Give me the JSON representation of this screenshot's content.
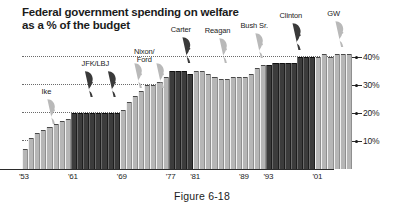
{
  "figure": {
    "caption": "Figure 6-18"
  },
  "chart_data": {
    "type": "bar",
    "title": "Federal government spending on welfare as a % of the budget",
    "title_lines": [
      "Federal government spending on welfare",
      "as a % of the budget"
    ],
    "xlabel": "",
    "ylabel": "",
    "ylim": [
      0,
      45
    ],
    "grid": true,
    "grid_values": [
      10,
      20,
      30,
      40
    ],
    "ytick_labels": [
      "40%",
      "30%",
      "20%",
      "10%"
    ],
    "ytick_values": [
      40,
      30,
      20,
      10
    ],
    "xtick_labels": [
      "'53",
      "'61",
      "'69",
      "'77",
      "'81",
      "'89",
      "'93",
      "'01"
    ],
    "xtick_years": [
      1953,
      1961,
      1969,
      1977,
      1981,
      1989,
      1993,
      2001
    ],
    "legend_position": "none",
    "x": [
      1953,
      1954,
      1955,
      1956,
      1957,
      1958,
      1959,
      1960,
      1961,
      1962,
      1963,
      1964,
      1965,
      1966,
      1967,
      1968,
      1969,
      1970,
      1971,
      1972,
      1973,
      1974,
      1975,
      1976,
      1977,
      1978,
      1979,
      1980,
      1981,
      1982,
      1983,
      1984,
      1985,
      1986,
      1987,
      1988,
      1989,
      1990,
      1991,
      1992,
      1993,
      1994,
      1995,
      1996,
      1997,
      1998,
      1999,
      2000,
      2001,
      2002,
      2003,
      2004,
      2005,
      2006
    ],
    "values": [
      7,
      11,
      13,
      14,
      15,
      16,
      17,
      18,
      20,
      20,
      20,
      20,
      20,
      20,
      20,
      20,
      21,
      24,
      26,
      28,
      30,
      30,
      31,
      33,
      35,
      35,
      35,
      34,
      35,
      35,
      34,
      33,
      32,
      32,
      33,
      33,
      33,
      34,
      36,
      37,
      37,
      38,
      38,
      38,
      38,
      40,
      40,
      40,
      40,
      41,
      40,
      41,
      41,
      41
    ],
    "series": [
      {
        "name": "Federal welfare spending (% of budget)",
        "values": [
          7,
          11,
          13,
          14,
          15,
          16,
          17,
          18,
          20,
          20,
          20,
          20,
          20,
          20,
          20,
          20,
          21,
          24,
          26,
          28,
          30,
          30,
          31,
          33,
          35,
          35,
          35,
          34,
          35,
          35,
          34,
          33,
          32,
          32,
          33,
          33,
          33,
          34,
          36,
          37,
          37,
          38,
          38,
          38,
          38,
          40,
          40,
          40,
          40,
          41,
          40,
          41,
          41,
          41
        ]
      }
    ],
    "bar_shading": {
      "light_color": "#b6b6b6",
      "dark_color": "#3c3c3c",
      "note": "Dark bars mark Democratic administrations, light bars mark Republican administrations"
    },
    "dark_year_ranges": [
      [
        1961,
        1968
      ],
      [
        1977,
        1980
      ],
      [
        1993,
        2000
      ]
    ],
    "annotations": [
      {
        "label": "Ike",
        "label_lines": [
          "Ike"
        ],
        "years": [
          1953,
          1960
        ],
        "heads": 1,
        "head_tone": "light"
      },
      {
        "label": "JFK/LBJ",
        "label_lines": [
          "JFK/LBJ"
        ],
        "years": [
          1961,
          1968
        ],
        "heads": 2,
        "head_tone": "dark"
      },
      {
        "label": "Nixon/Ford",
        "label_lines": [
          "Nixon/",
          "Ford"
        ],
        "years": [
          1969,
          1976
        ],
        "heads": 2,
        "head_tone": "light"
      },
      {
        "label": "Carter",
        "label_lines": [
          "Carter"
        ],
        "years": [
          1977,
          1980
        ],
        "heads": 1,
        "head_tone": "dark"
      },
      {
        "label": "Reagan",
        "label_lines": [
          "Reagan"
        ],
        "years": [
          1981,
          1988
        ],
        "heads": 1,
        "head_tone": "light"
      },
      {
        "label": "Bush Sr.",
        "label_lines": [
          "Bush Sr."
        ],
        "years": [
          1989,
          1992
        ],
        "heads": 1,
        "head_tone": "light"
      },
      {
        "label": "Clinton",
        "label_lines": [
          "Clinton"
        ],
        "years": [
          1993,
          2000
        ],
        "heads": 1,
        "head_tone": "dark"
      },
      {
        "label": "GW",
        "label_lines": [
          "GW"
        ],
        "years": [
          2001,
          2006
        ],
        "heads": 1,
        "head_tone": "light"
      }
    ]
  }
}
